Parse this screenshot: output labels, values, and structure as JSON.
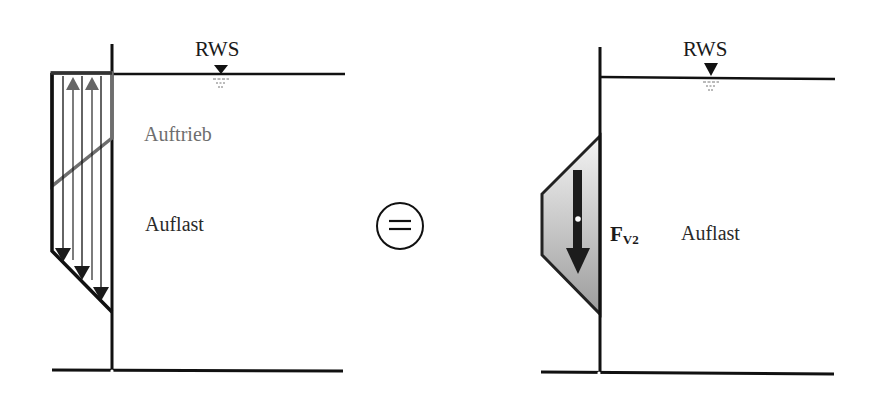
{
  "left_panel": {
    "water_level_label": "RWS",
    "upper_region_label": "Auftrieb",
    "lower_region_label": "Auflast",
    "upward_arrows": 2,
    "downward_arrows": 3
  },
  "operator": {
    "symbol": "="
  },
  "right_panel": {
    "water_level_label": "RWS",
    "force_label": "F",
    "force_subscript": "V2",
    "region_label": "Auflast"
  },
  "colors": {
    "line": "#111111",
    "uplift": "#6e6e6e",
    "fill_top": "#f2f2f2",
    "fill_bottom": "#9a9a9a"
  }
}
